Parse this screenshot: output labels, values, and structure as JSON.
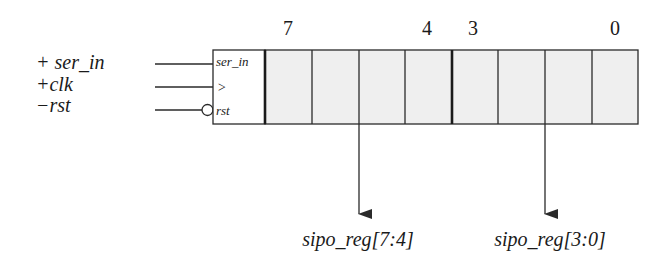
{
  "diagram": {
    "title": "",
    "inputs": [
      {
        "label": "+ ser_in",
        "pin": "ser_in",
        "y": 64,
        "inverted": false
      },
      {
        "label": "+clk",
        "pin": ">",
        "y": 87,
        "inverted": false
      },
      {
        "label": "−rst",
        "pin": "rst",
        "y": 110,
        "inverted": true
      }
    ],
    "register": {
      "bit_labels": [
        {
          "text": "7",
          "x": 288
        },
        {
          "text": "4",
          "x": 427
        },
        {
          "text": "3",
          "x": 473
        },
        {
          "text": "0",
          "x": 615
        }
      ],
      "cells": 8,
      "cell_fill": "#efefef"
    },
    "outputs": [
      {
        "label": "sipo_reg[7:4]",
        "x": 359
      },
      {
        "label": "sipo_reg[3:0]",
        "x": 545
      }
    ],
    "colors": {
      "stroke": "#2a2a2a",
      "cell_fill": "#efefef",
      "background": "#ffffff"
    }
  }
}
